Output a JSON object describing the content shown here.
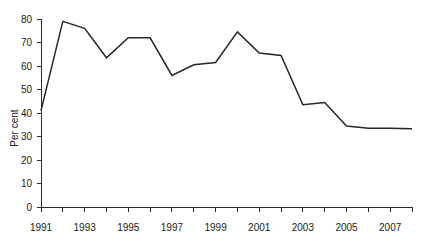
{
  "chart_data": {
    "type": "line",
    "title": "",
    "xlabel": "",
    "ylabel": "Per cent",
    "ylim": [
      0,
      80
    ],
    "xlim": [
      1991,
      2008
    ],
    "grid": false,
    "legend": "none",
    "line_color": "#262626",
    "axis_color": "#2b2b2b",
    "y_ticks": [
      0,
      10,
      20,
      30,
      40,
      50,
      60,
      70,
      80
    ],
    "y_tick_labels": [
      "0",
      "10",
      "20",
      "30",
      "40",
      "50",
      "60",
      "70",
      "80"
    ],
    "x_ticks": [
      1991,
      1992,
      1993,
      1994,
      1995,
      1996,
      1997,
      1998,
      1999,
      2000,
      2001,
      2002,
      2003,
      2004,
      2005,
      2006,
      2007,
      2008
    ],
    "x_tick_labels": [
      "1991",
      "",
      "1993",
      "",
      "1995",
      "",
      "1997",
      "",
      "1999",
      "",
      "2001",
      "",
      "2003",
      "",
      "2005",
      "",
      "2007",
      ""
    ],
    "x": [
      1991,
      1992,
      1993,
      1994,
      1995,
      1996,
      1997,
      1998,
      1999,
      2000,
      2001,
      2002,
      2003,
      2004,
      2005,
      2006,
      2007,
      2008
    ],
    "values": [
      41,
      79,
      76,
      63.5,
      72,
      72,
      56,
      60.5,
      61.5,
      74.5,
      65.5,
      64.5,
      43.5,
      44.5,
      34.5,
      33.5,
      33.5,
      33.3
    ],
    "series": [
      {
        "name": "Per cent",
        "values": [
          41,
          79,
          76,
          63.5,
          72,
          72,
          56,
          60.5,
          61.5,
          74.5,
          65.5,
          64.5,
          43.5,
          44.5,
          34.5,
          33.5,
          33.5,
          33.3
        ]
      }
    ]
  }
}
